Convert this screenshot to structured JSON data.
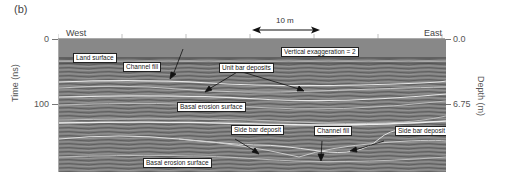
{
  "figure": {
    "panel_label": "(b)",
    "directions": {
      "left": "West",
      "right": "East"
    },
    "scale_bar": {
      "label": "10 m"
    },
    "annotation_ve": "Vertical exaggeration = 2",
    "left_axis": {
      "title": "Time (ns)",
      "ticks": [
        "0",
        "100"
      ]
    },
    "right_axis": {
      "title": "Depth (m)",
      "ticks": [
        "0.0",
        "6.75"
      ]
    },
    "callouts": [
      {
        "id": "land-surface",
        "text": "Land surface"
      },
      {
        "id": "channel-fill-upper",
        "text": "Channel fill"
      },
      {
        "id": "unit-bar-deposits",
        "text": "Unit bar deposits"
      },
      {
        "id": "basal-erosion-upper",
        "text": "Basal erosion surface"
      },
      {
        "id": "side-bar-left",
        "text": "Side bar deposit"
      },
      {
        "id": "channel-fill-lower",
        "text": "Channel fill"
      },
      {
        "id": "side-bar-right",
        "text": "Side bar deposit"
      },
      {
        "id": "basal-erosion-lower",
        "text": "Basal erosion surface"
      }
    ],
    "colors": {
      "radar_bg": "#7b7b7b",
      "air_band": "#8a8a8a",
      "reflector": "#e6e6e6",
      "dark_line": "#3a3a3a"
    }
  }
}
